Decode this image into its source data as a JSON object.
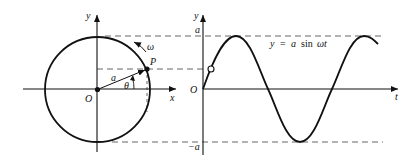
{
  "left_figure": {
    "title": "rotating vector on circle",
    "labels": {
      "y_axis": "y",
      "x_axis": "x",
      "origin": "O",
      "point": "P",
      "radius": "a",
      "angle": "θ",
      "angular_velocity": "ω"
    }
  },
  "right_figure": {
    "labels": {
      "y_axis": "y",
      "t_axis": "t",
      "origin": "O",
      "amplitude_pos": "a",
      "amplitude_neg": "−a",
      "equation_y": "y",
      "equation_eq": "=",
      "equation_a": "a",
      "equation_sin": "sin",
      "equation_wt": "ωt"
    }
  },
  "colors": {
    "stroke": "#111111",
    "dash": "#555555",
    "background": "#ffffff"
  }
}
